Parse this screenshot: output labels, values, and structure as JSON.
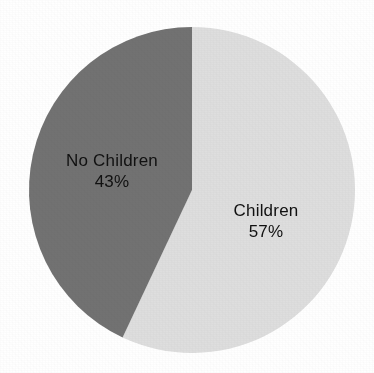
{
  "figure": {
    "background_color": "#ffffff",
    "width": 374,
    "height": 373
  },
  "chart_data": {
    "type": "pie",
    "title": "",
    "subtitle": "",
    "xlabel": "",
    "ylabel": "",
    "legend_position": "none",
    "grid": false,
    "units": "percent",
    "start_angle_deg": 0,
    "direction": "clockwise",
    "center": {
      "x": 192,
      "y": 190
    },
    "radius": 163,
    "categories": [
      "Children",
      "No Children"
    ],
    "values": [
      57,
      43
    ],
    "slices": [
      {
        "label": "Children",
        "value": 57,
        "value_text": "57%",
        "color": "#dedede",
        "start_angle_deg": 0,
        "end_angle_deg": 205.2,
        "label_x": 266,
        "label_y": 210
      },
      {
        "label": "No Children",
        "value": 43,
        "value_text": "43%",
        "color": "#727272",
        "start_angle_deg": 205.2,
        "end_angle_deg": 360,
        "label_x": 112,
        "label_y": 160
      }
    ],
    "colors": [
      "#dedede",
      "#727272"
    ],
    "label_text_color": "#111111"
  }
}
